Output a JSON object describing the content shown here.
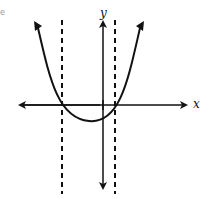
{
  "figure": {
    "x_axis_label": "x",
    "y_axis_label": "y",
    "corner_fragment": "e",
    "colors": {
      "stroke": "#111111",
      "background": "#ffffff"
    }
  }
}
